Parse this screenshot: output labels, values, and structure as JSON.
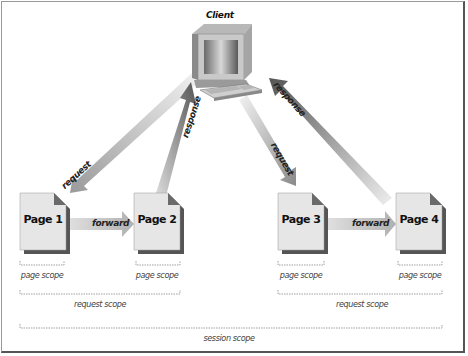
{
  "diagram": {
    "client": {
      "label": "Client",
      "icon": "computer-icon"
    },
    "pages": [
      {
        "id": "page1",
        "label": "Page 1"
      },
      {
        "id": "page2",
        "label": "Page 2"
      },
      {
        "id": "page3",
        "label": "Page 3"
      },
      {
        "id": "page4",
        "label": "Page 4"
      }
    ],
    "arrows": {
      "request_1": "request",
      "response_1": "response",
      "request_2": "request",
      "response_2": "response",
      "forward_1": "forward",
      "forward_2": "forward"
    },
    "scopes": {
      "page_scope_1": "page scope",
      "page_scope_2": "page scope",
      "page_scope_3": "page scope",
      "page_scope_4": "page scope",
      "request_scope_1": "request scope",
      "request_scope_2": "request scope",
      "session_scope": "session scope"
    },
    "colors": {
      "page_fill": "#e4e4e4",
      "page_shadow": "#555555",
      "arrow_light": "#e8e8e8",
      "arrow_dark": "#777777",
      "bracket": "#888888"
    }
  }
}
